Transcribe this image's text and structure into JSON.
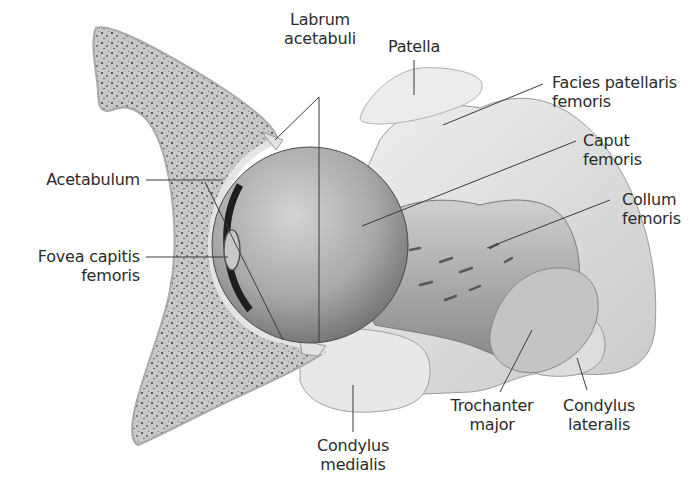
{
  "figure": {
    "colors": {
      "background": "#ffffff",
      "bone_cortex": "#d9d9d9",
      "spongy_bone": "#bdbdbd",
      "femoral_head": "#a9a9a9",
      "light_bone": "#e6e6e6",
      "leader_line": "#3a3a3a",
      "label_text": "#2b2b2b"
    }
  },
  "labels": {
    "labrum": {
      "line1": "Labrum",
      "line2": "acetabuli"
    },
    "patella": {
      "line1": "Patella"
    },
    "facies": {
      "line1": "Facies patellaris",
      "line2": "femoris"
    },
    "caput": {
      "line1": "Caput",
      "line2": "femoris"
    },
    "collum": {
      "line1": "Collum",
      "line2": "femoris"
    },
    "acetabulum": {
      "line1": "Acetabulum"
    },
    "fovea": {
      "line1": "Fovea capitis",
      "line2": "femoris"
    },
    "trochanter": {
      "line1": "Trochanter",
      "line2": "major"
    },
    "cond_lat": {
      "line1": "Condylus",
      "line2": "lateralis"
    },
    "cond_med": {
      "line1": "Condylus",
      "line2": "medialis"
    }
  }
}
